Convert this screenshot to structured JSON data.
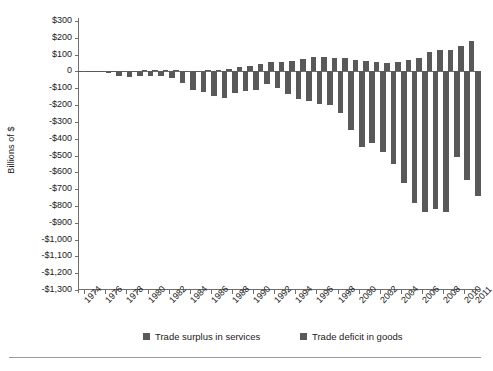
{
  "chart_data": {
    "type": "bar",
    "title": "",
    "xlabel": "",
    "ylabel": "Billions of $",
    "ylim": [
      -1300,
      300
    ],
    "ytick_step": 100,
    "grid": false,
    "legend_position": "bottom",
    "bar_color": "#595959",
    "axis_color": "#6e6e6e",
    "categories": [
      "1974",
      "1975",
      "1976",
      "1977",
      "1978",
      "1979",
      "1980",
      "1981",
      "1982",
      "1983",
      "1984",
      "1985",
      "1986",
      "1987",
      "1988",
      "1989",
      "1990",
      "1991",
      "1992",
      "1993",
      "1994",
      "1995",
      "1996",
      "1997",
      "1998",
      "1999",
      "2000",
      "2001",
      "2002",
      "2003",
      "2004",
      "2005",
      "2006",
      "2007",
      "2008",
      "2009",
      "2010",
      "2011"
    ],
    "xtick_labels": [
      "1974",
      "1976",
      "1978",
      "1980",
      "1982",
      "1984",
      "1986",
      "1988",
      "1990",
      "1992",
      "1994",
      "1996",
      "1998",
      "2000",
      "2002",
      "2004",
      "2006",
      "2008",
      "2010",
      "2011"
    ],
    "ytick_labels": [
      "$300",
      "$200",
      "$100",
      "0",
      "-$100",
      "-$200",
      "-$300",
      "-$400",
      "-$500",
      "-$600",
      "-$700",
      "-$800",
      "-$900",
      "-$1,000",
      "-$1,100",
      "-$1,200",
      "-$1,300"
    ],
    "ytick_values": [
      300,
      200,
      100,
      0,
      -100,
      -200,
      -300,
      -400,
      -500,
      -600,
      -700,
      -800,
      -900,
      -1000,
      -1100,
      -1200,
      -1300
    ],
    "series": [
      {
        "name": "Trade surplus in services",
        "values": [
          2,
          3,
          3,
          3,
          4,
          5,
          6,
          9,
          10,
          8,
          3,
          1,
          7,
          9,
          17,
          26,
          30,
          45,
          56,
          59,
          64,
          73,
          83,
          88,
          80,
          81,
          69,
          62,
          58,
          52,
          55,
          68,
          80,
          115,
          125,
          130,
          150,
          180
        ]
      },
      {
        "name": "Trade deficit in goods",
        "values": [
          -6,
          -4,
          -12,
          -30,
          -34,
          -28,
          -26,
          -28,
          -37,
          -67,
          -113,
          -122,
          -145,
          -160,
          -127,
          -116,
          -111,
          -77,
          -97,
          -133,
          -166,
          -174,
          -191,
          -199,
          -247,
          -346,
          -452,
          -427,
          -482,
          -549,
          -666,
          -783,
          -838,
          -819,
          -834,
          -509,
          -646,
          -738
        ]
      }
    ]
  },
  "legend": {
    "services_label": "Trade surplus in services",
    "goods_label": "Trade deficit in goods"
  },
  "footer": {
    "note": ""
  }
}
